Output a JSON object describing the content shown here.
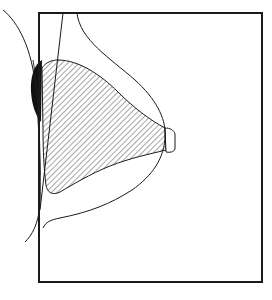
{
  "diagram": {
    "type": "anatomical-line-drawing",
    "elements": [
      {
        "name": "image-frame",
        "kind": "rectangle"
      },
      {
        "name": "breast-outline",
        "kind": "curve"
      },
      {
        "name": "glandular-tissue",
        "kind": "hatched-region"
      },
      {
        "name": "nipple",
        "kind": "small-shape"
      },
      {
        "name": "pectoral-muscle-edge",
        "kind": "line"
      },
      {
        "name": "chest-wall-contour",
        "kind": "curve"
      },
      {
        "name": "dense-tissue-shaded",
        "kind": "solid-black-region"
      }
    ],
    "colors": {
      "line": "#1a1a1a",
      "background": "#ffffff",
      "hatch": "#3a3a3a",
      "fill": "#111111"
    }
  }
}
